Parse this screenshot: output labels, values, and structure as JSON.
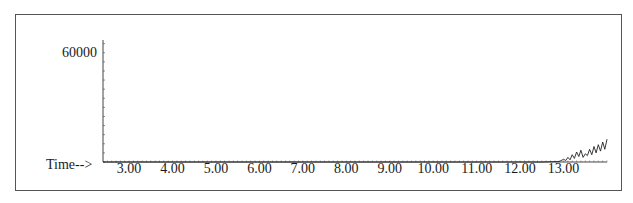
{
  "chart_data": {
    "type": "line",
    "title": "",
    "xlabel": "Time-->",
    "ylabel": "",
    "x_ticks": [
      "3.00",
      "4.00",
      "5.00",
      "6.00",
      "7.00",
      "8.00",
      "9.00",
      "10.00",
      "11.00",
      "12.00",
      "13.00"
    ],
    "y_ticks": [
      "60000"
    ],
    "xlim": [
      2.4,
      14.0
    ],
    "ylim": [
      0,
      67000
    ],
    "grid": false,
    "series": [
      {
        "name": "abundance",
        "x": [
          2.4,
          12.5,
          12.9,
          13.0,
          13.05,
          13.1,
          13.15,
          13.2,
          13.25,
          13.3,
          13.35,
          13.4,
          13.45,
          13.5,
          13.55,
          13.6,
          13.65,
          13.7,
          13.75,
          13.8,
          13.85,
          13.9,
          13.95,
          14.0
        ],
        "values": [
          0,
          0,
          300,
          1500,
          800,
          2500,
          1200,
          4000,
          2000,
          5500,
          3000,
          6500,
          2500,
          4500,
          3500,
          7000,
          4000,
          8500,
          5000,
          9500,
          6000,
          11000,
          7000,
          12500
        ]
      }
    ]
  },
  "labels": {
    "y60000": "60000",
    "time": "Time-->"
  }
}
